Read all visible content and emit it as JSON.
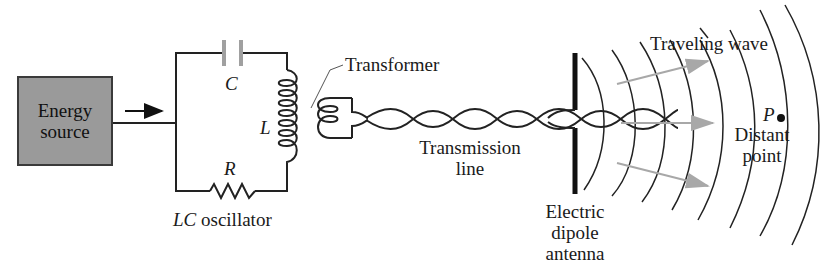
{
  "diagram": {
    "energy_source": {
      "line1": "Energy",
      "line2": "source"
    },
    "oscillator": {
      "capacitor_label": "C",
      "inductor_label": "L",
      "resistor_label": "R",
      "caption_italic": "LC",
      "caption_text": " oscillator"
    },
    "transformer_label": "Transformer",
    "transmission_line": {
      "line1": "Transmission",
      "line2": "line"
    },
    "antenna": {
      "line1": "Electric",
      "line2": "dipole",
      "line3": "antenna"
    },
    "traveling_wave_label": "Traveling wave",
    "point": {
      "symbol": "P",
      "line1": "Distant",
      "line2": "point"
    },
    "colors": {
      "box_fill": "#9a9a9a",
      "wave_arrow": "#a8a8a8",
      "line": "#222222"
    }
  }
}
